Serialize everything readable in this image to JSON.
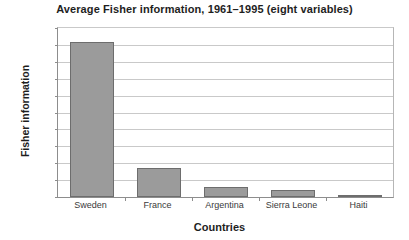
{
  "chart_data": {
    "type": "bar",
    "title": "Average Fisher information, 1961–1995 (eight variables)",
    "xlabel": "Countries",
    "ylabel": "Fisher information",
    "categories": [
      "Sweden",
      "France",
      "Argentina",
      "Sierra Leone",
      "Haiti"
    ],
    "values": [
      4.6,
      0.85,
      0.3,
      0.2,
      0.05
    ],
    "ylim": [
      0,
      5
    ],
    "ytick_step": 0.5,
    "ytick_labels": [
      "0",
      "0.5",
      "1",
      "1.5",
      "2",
      "2.5",
      "3",
      "3.5",
      "4",
      "4.5",
      "5"
    ],
    "ytick_values": [
      0,
      0.5,
      1,
      1.5,
      2,
      2.5,
      3,
      3.5,
      4,
      4.5,
      5
    ],
    "grid": "horizontal",
    "legend": "none",
    "bar_fill_color": "#9b9b9b",
    "bar_edge_color": "#6d6d6d",
    "gridline_color": "#c9c9c9",
    "axis_color": "#8d8d8d",
    "background_color": "#ffffff"
  }
}
